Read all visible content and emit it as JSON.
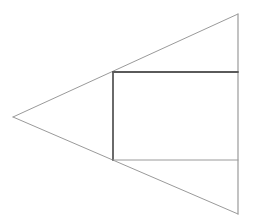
{
  "canvas": {
    "width": 254,
    "height": 224,
    "background": "#ffffff"
  },
  "colors": {
    "thin_line": "#9a9a9a",
    "thick_line": "#5a5a5a"
  },
  "triangle": {
    "apex_left": [
      13,
      117
    ],
    "top_right": [
      238,
      14
    ],
    "bottom_right": [
      238,
      214
    ]
  },
  "rectangle": {
    "top_left": [
      113,
      72
    ],
    "top_right": [
      238,
      72
    ],
    "bottom_left": [
      113,
      160
    ],
    "bottom_right": [
      238,
      160
    ]
  }
}
